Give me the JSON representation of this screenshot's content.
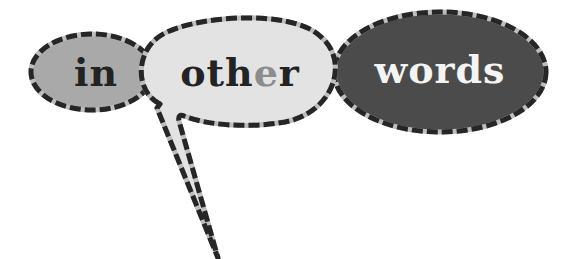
{
  "logo": {
    "words": [
      {
        "text": "in",
        "fill": "#a9a9a9",
        "text_color": "#232323"
      },
      {
        "text_parts": [
          "oth",
          "e",
          "r"
        ],
        "fill": "#e3e3e3",
        "text_color": "#232323",
        "accent_color": "#8c8c8c"
      },
      {
        "text": "words",
        "fill": "#4b4b4b",
        "text_color": "#f4f4f4"
      }
    ],
    "border_dark": "#262626",
    "border_light": "#bdbdbd"
  }
}
